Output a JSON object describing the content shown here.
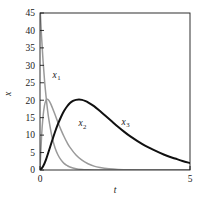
{
  "chart_data": {
    "type": "line",
    "title": "",
    "xlabel": "t",
    "ylabel": "x",
    "xlim": [
      0,
      5
    ],
    "ylim": [
      0,
      45
    ],
    "grid": false,
    "legend_position": "inline-annotations",
    "x_ticks": [
      "0",
      "5"
    ],
    "x_tick_values": [
      0,
      5
    ],
    "y_ticks": [
      "0",
      "5",
      "10",
      "15",
      "20",
      "25",
      "30",
      "35",
      "40",
      "45"
    ],
    "y_tick_values": [
      0,
      5,
      10,
      15,
      20,
      25,
      30,
      35,
      40,
      45
    ],
    "colors": {
      "x1": "#9a9a9a",
      "x2": "#9a9a9a",
      "x3": "#101010",
      "axis": "#1a1a1a",
      "background": "#ffffff"
    },
    "annotations": [
      {
        "text": "x",
        "sub": "1",
        "x": 0.42,
        "y": 26.5
      },
      {
        "text": "x",
        "sub": "2",
        "x": 1.28,
        "y": 12.5
      },
      {
        "text": "x",
        "sub": "3",
        "x": 2.72,
        "y": 13.0
      }
    ],
    "series": [
      {
        "name": "x1",
        "label": "x₁",
        "color": "#9a9a9a",
        "width": 1.5,
        "x": [
          0,
          0.05,
          0.1,
          0.15,
          0.2,
          0.25,
          0.3,
          0.4,
          0.5,
          0.6,
          0.7,
          0.8,
          0.9,
          1.0,
          1.2,
          1.4,
          1.6,
          1.8,
          2.0,
          2.5,
          3.0,
          3.5,
          4.0,
          4.5,
          5.0
        ],
        "values": [
          47.0,
          38.5,
          31.5,
          25.8,
          21.2,
          17.3,
          14.2,
          9.5,
          6.4,
          4.3,
          2.9,
          1.9,
          1.3,
          0.86,
          0.39,
          0.17,
          0.08,
          0.03,
          0.015,
          0.002,
          0.0,
          0.0,
          0.0,
          0.0,
          0.0
        ]
      },
      {
        "name": "x2",
        "label": "x₂",
        "color": "#9a9a9a",
        "width": 1.5,
        "x": [
          0,
          0.05,
          0.1,
          0.15,
          0.2,
          0.25,
          0.3,
          0.35,
          0.4,
          0.5,
          0.6,
          0.7,
          0.8,
          0.9,
          1.0,
          1.2,
          1.4,
          1.6,
          1.8,
          2.0,
          2.3,
          2.6,
          3.0,
          3.5,
          4.0,
          4.5,
          5.0
        ],
        "values": [
          0.0,
          9.3,
          15.2,
          18.5,
          20.0,
          20.3,
          19.9,
          19.1,
          18.1,
          15.9,
          13.6,
          11.5,
          9.6,
          7.9,
          6.5,
          4.3,
          2.8,
          1.8,
          1.1,
          0.7,
          0.35,
          0.17,
          0.06,
          0.015,
          0.004,
          0.001,
          0.0
        ]
      },
      {
        "name": "x3",
        "label": "x₃",
        "color": "#101010",
        "width": 2.0,
        "x": [
          0,
          0.1,
          0.2,
          0.3,
          0.4,
          0.5,
          0.6,
          0.7,
          0.8,
          0.9,
          1.0,
          1.1,
          1.2,
          1.3,
          1.4,
          1.5,
          1.6,
          1.8,
          2.0,
          2.2,
          2.4,
          2.6,
          2.8,
          3.0,
          3.25,
          3.5,
          3.75,
          4.0,
          4.25,
          4.5,
          4.75,
          5.0
        ],
        "values": [
          0.0,
          1.0,
          3.0,
          5.6,
          8.3,
          10.9,
          13.2,
          15.2,
          16.9,
          18.2,
          19.2,
          19.8,
          20.1,
          20.2,
          20.1,
          19.8,
          19.4,
          18.3,
          16.9,
          15.4,
          13.9,
          12.4,
          11.0,
          9.7,
          8.3,
          7.0,
          5.9,
          4.9,
          4.0,
          3.3,
          2.6,
          2.0
        ]
      }
    ]
  },
  "axes": {
    "x_title": "t",
    "y_title": "x"
  }
}
